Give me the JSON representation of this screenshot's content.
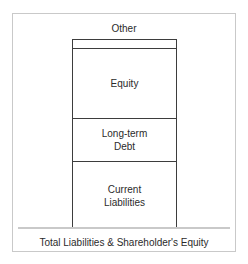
{
  "figure": {
    "caption": "Total Liabilities & Shareholder's Equity",
    "external_label": "Other",
    "frame_color": "#c9c9c9",
    "bar_outline_color": "#3d3d3d",
    "baseline_color": "#c9c9c9",
    "text_color": "#2b2b2b",
    "fill_color": "#ffffff"
  },
  "chart_data": {
    "type": "bar",
    "title": "",
    "subtitle": "",
    "xlabel": "Total Liabilities & Shareholder's Equity",
    "ylabel": "",
    "orientation": "vertical",
    "stacked": true,
    "grid": false,
    "legend": "none",
    "categories": [
      "Total Liabilities & Shareholder's Equity"
    ],
    "series": [
      {
        "name": "Current Liabilities",
        "values": [
          67
        ],
        "label": "Current\nLiabilities",
        "label_inside": true
      },
      {
        "name": "Long-term Debt",
        "values": [
          43
        ],
        "label": "Long-term\nDebt",
        "label_inside": true
      },
      {
        "name": "Equity",
        "values": [
          70
        ],
        "label": "Equity",
        "label_inside": true
      },
      {
        "name": "Other",
        "values": [
          9
        ],
        "label": "Other",
        "label_inside": false
      }
    ],
    "stack_order_bottom_to_top": [
      "Current Liabilities",
      "Long-term Debt",
      "Equity",
      "Other"
    ],
    "ylim": [
      0,
      189
    ],
    "units": "pixels (relative segment heights)",
    "annotations": [
      {
        "text": "Other",
        "position": "above-bar",
        "refers_to": "Other"
      }
    ]
  },
  "segments": {
    "other": {
      "label": "Other"
    },
    "equity": {
      "label": "Equity"
    },
    "long_term_debt": {
      "label": "Long-term\nDebt"
    },
    "current_liabilities": {
      "label": "Current\nLiabilities"
    }
  }
}
